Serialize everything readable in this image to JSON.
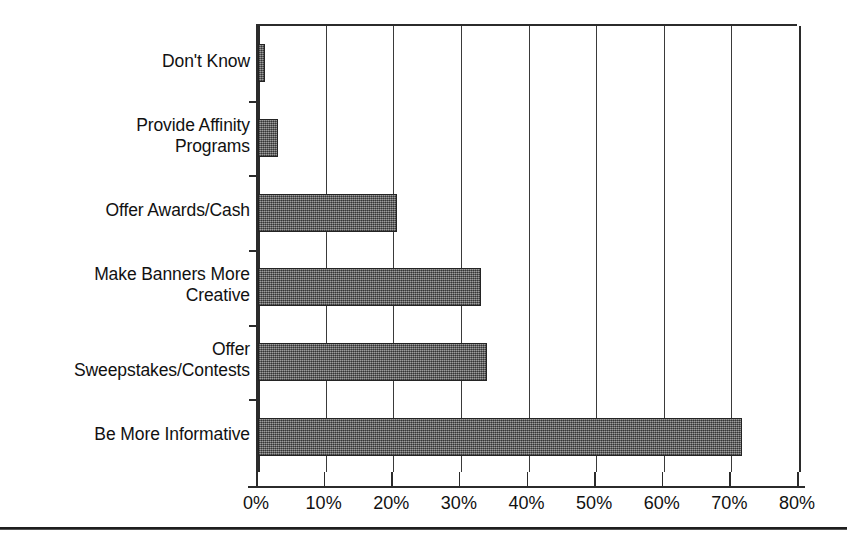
{
  "chart_data": {
    "type": "bar",
    "orientation": "horizontal",
    "title": "",
    "subtitle": "",
    "xlabel": "",
    "ylabel": "",
    "categories": [
      "Don't Know",
      "Provide Affinity\nPrograms",
      "Offer Awards/Cash",
      "Make Banners More\nCreative",
      "Offer\nSweepstakes/Contests",
      "Be More Informative"
    ],
    "values": [
      1,
      3,
      20.5,
      33,
      33.8,
      71.5
    ],
    "value_labels": [
      "1%",
      "3%",
      "20.5%",
      "33%",
      "33.8%",
      "71.5%"
    ],
    "xlim": [
      0,
      80
    ],
    "xticks": [
      0,
      10,
      20,
      30,
      40,
      50,
      60,
      70,
      80
    ],
    "xtick_labels": [
      "0%",
      "10%",
      "20%",
      "30%",
      "40%",
      "50%",
      "60%",
      "70%",
      "80%"
    ],
    "grid": "vertical",
    "legend": null,
    "bar_color": "#6e6e6e",
    "bar_border_color": "#242424",
    "axis_color": "#2b2b2b",
    "background_color": "#ffffff"
  },
  "figure": {
    "bottom_rule_color": "#1e1e1e"
  }
}
